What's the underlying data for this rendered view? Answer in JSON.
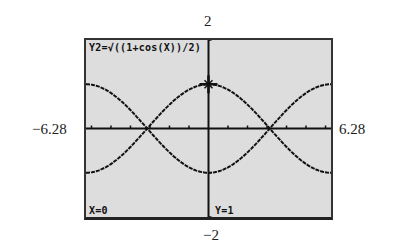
{
  "window": {
    "ymax_label": "2",
    "ymin_label": "−2",
    "xmin_label": "−6.28",
    "xmax_label": "6.28"
  },
  "screen": {
    "equation": "Y2=√((1+cos(X))/2)",
    "cursor_x": "X=0",
    "cursor_y": "Y=1",
    "background_color": "#dddddd",
    "ink_color": "#111111",
    "trace_cursor_icon": "plus-cross-cursor"
  },
  "chart_data": {
    "type": "line",
    "title": "Y2=√((1+cos(X))/2)",
    "xlabel": "",
    "ylabel": "",
    "xlim": [
      -6.28,
      6.28
    ],
    "ylim": [
      -2,
      2
    ],
    "grid": false,
    "xscl_ticks": true,
    "series": [
      {
        "name": "Y1 = −√((1+cos(X))/2)",
        "x": [
          -6.28,
          -4.71,
          -3.14,
          -1.57,
          0,
          1.57,
          3.14,
          4.71,
          6.28
        ],
        "values": [
          -1,
          -0.71,
          0,
          0.71,
          1,
          0.71,
          0,
          -0.71,
          -1
        ]
      },
      {
        "name": "Y2 = √((1+cos(X))/2)",
        "x": [
          -6.28,
          -4.71,
          -3.14,
          -1.57,
          0,
          1.57,
          3.14,
          4.71,
          6.28
        ],
        "values": [
          1,
          0.71,
          0,
          0.71,
          1,
          0.71,
          0,
          0.71,
          1
        ]
      }
    ],
    "trace_point": {
      "x": 0,
      "y": 1
    }
  }
}
